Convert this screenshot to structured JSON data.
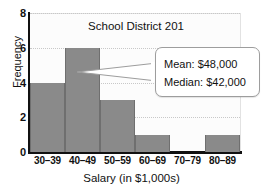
{
  "chart_data": {
    "type": "bar",
    "title": "School District 201",
    "xlabel": "Salary (in $1,000s)",
    "ylabel": "Frequency",
    "categories": [
      "30–39",
      "40–49",
      "50–59",
      "60–69",
      "70–79",
      "80–89"
    ],
    "values": [
      4,
      6,
      3,
      1,
      0,
      1
    ],
    "ylim": [
      0,
      8
    ],
    "yticks": [
      "0",
      "2",
      "4",
      "6",
      "8"
    ],
    "ytick_values": [
      0,
      2,
      4,
      6,
      8
    ],
    "gridlines": true,
    "grid_axis": "y",
    "legend": "none",
    "bar_color": "#8a8a8a",
    "axis_color": "#111111",
    "annotations": [
      {
        "name": "summary-callout",
        "lines": [
          "Mean: $48,000",
          "Median: $42,000"
        ],
        "points_to_category": "40–49"
      }
    ]
  }
}
